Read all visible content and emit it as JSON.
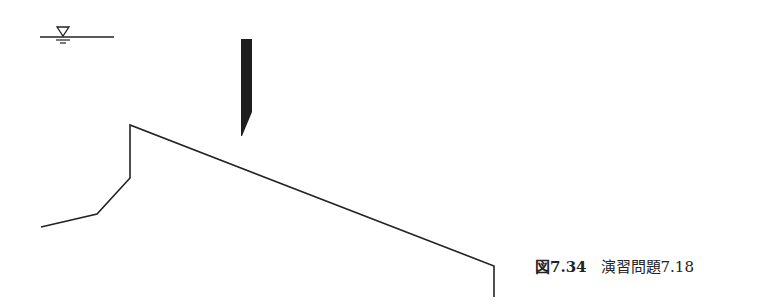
{
  "figure": {
    "water_level_symbol": "water-surface-triangle",
    "colors": {
      "line": "#222222",
      "pile_fill": "#1e1e1e"
    }
  },
  "caption": {
    "label": "図7.34",
    "text": "演習問題7.18"
  }
}
